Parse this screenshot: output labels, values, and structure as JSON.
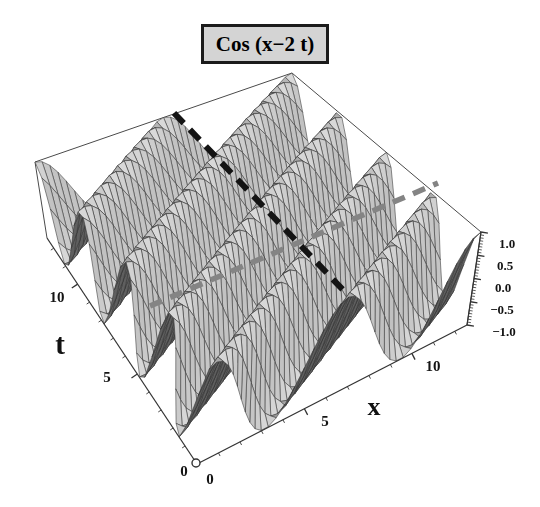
{
  "title": "Cos (x−2 t)",
  "axes": {
    "x": {
      "label": "x",
      "ticks": [
        "0",
        "5",
        "10"
      ]
    },
    "t": {
      "label": "t",
      "ticks": [
        "0",
        "5",
        "10"
      ]
    },
    "z": {
      "ticks": [
        "1.0",
        "0.5",
        "0.0",
        "−0.5",
        "−1.0"
      ]
    }
  },
  "chart_data": {
    "type": "surface",
    "function": "cos(x − 2 t)",
    "x_range": [
      0,
      12.566
    ],
    "t_range": [
      0,
      12.566
    ],
    "z_range": [
      -1,
      1
    ],
    "x_tick_values": [
      0,
      5,
      10
    ],
    "t_tick_values": [
      0,
      5,
      10
    ],
    "z_tick_values": [
      1.0,
      0.5,
      0.0,
      -0.5,
      -1.0
    ],
    "mesh_divisions": [
      38,
      34
    ],
    "annotations": [
      {
        "kind": "dashed-line",
        "color_key": "dash_gray",
        "from": [
          150,
          306
        ],
        "to": [
          438,
          183
        ],
        "width": 5.5,
        "dash": [
          13,
          9
        ]
      },
      {
        "kind": "dashed-line",
        "color_key": "dash_black",
        "from": [
          174,
          113
        ],
        "to": [
          345,
          292
        ],
        "width": 6,
        "dash": [
          14,
          9
        ]
      }
    ],
    "origin_marker": {
      "kind": "open-circle",
      "screen": [
        196,
        463
      ],
      "radius": 4
    }
  },
  "colors": {
    "background": "#ffffff",
    "title_bg": "#d4d4d4",
    "title_border": "#1b1b1b",
    "frame_line": "#4a4a4a",
    "axis_line": "#333333",
    "mesh_line": "#333333",
    "surface_light": "#d9d9d9",
    "surface_dark": "#5f5f5f",
    "dash_black": "#141414",
    "dash_gray": "#848484",
    "text": "#111111"
  }
}
